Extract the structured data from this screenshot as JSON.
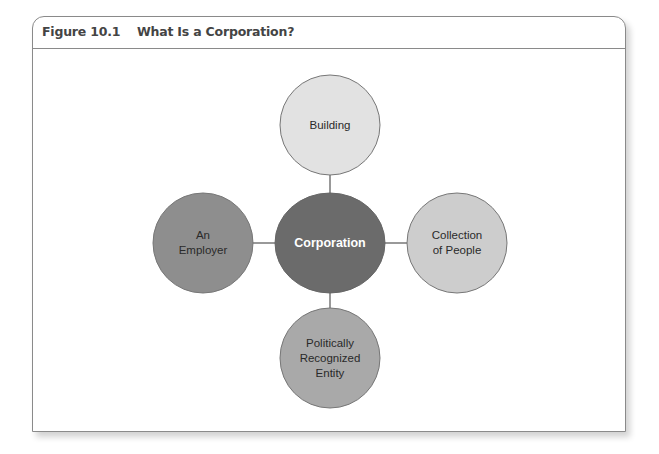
{
  "figure": {
    "number": "Figure 10.1",
    "title": "What Is a Corporation?"
  },
  "diagram": {
    "center": {
      "label": "Corporation",
      "color": "#6b6b6b"
    },
    "nodes": [
      {
        "id": "top",
        "lines": [
          "Building"
        ],
        "color": "#e2e2e2"
      },
      {
        "id": "left",
        "lines": [
          "An",
          "Employer"
        ],
        "color": "#8e8e8e"
      },
      {
        "id": "right",
        "lines": [
          "Collection",
          "of People"
        ],
        "color": "#cdcdcd"
      },
      {
        "id": "bottom",
        "lines": [
          "Politically",
          "Recognized",
          "Entity"
        ],
        "color": "#a9a9a9"
      }
    ],
    "connector_color": "#555555",
    "outline_color": "#777777"
  }
}
